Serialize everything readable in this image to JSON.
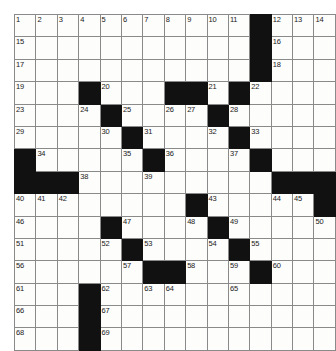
{
  "puzzle": {
    "type": "crossword-grid",
    "title": "",
    "rows": 15,
    "columns": 15,
    "cell_size_px": 20.5,
    "colors": {
      "block": "#111111",
      "cell": "#fdfdfb",
      "grid_line": "#8a8a8a",
      "number": "#1a1a1a",
      "page_background": "#ffffff"
    },
    "highest_clue_number": 69,
    "blocks": [
      [
        1,
        12
      ],
      [
        2,
        12
      ],
      [
        3,
        12
      ],
      [
        4,
        4
      ],
      [
        4,
        8
      ],
      [
        4,
        9
      ],
      [
        4,
        11
      ],
      [
        5,
        5
      ],
      [
        5,
        10
      ],
      [
        6,
        6
      ],
      [
        6,
        11
      ],
      [
        7,
        1
      ],
      [
        7,
        7
      ],
      [
        7,
        12
      ],
      [
        8,
        1
      ],
      [
        8,
        2
      ],
      [
        8,
        3
      ],
      [
        8,
        13
      ],
      [
        8,
        14
      ],
      [
        8,
        15
      ],
      [
        9,
        9
      ],
      [
        9,
        15
      ],
      [
        10,
        5
      ],
      [
        10,
        10
      ],
      [
        11,
        6
      ],
      [
        11,
        11
      ],
      [
        12,
        7
      ],
      [
        12,
        8
      ],
      [
        12,
        12
      ],
      [
        13,
        4
      ],
      [
        14,
        4
      ],
      [
        15,
        4
      ]
    ],
    "numbered_cells": [
      {
        "number": 1,
        "row": 1,
        "col": 1
      },
      {
        "number": 2,
        "row": 1,
        "col": 2
      },
      {
        "number": 3,
        "row": 1,
        "col": 3
      },
      {
        "number": 4,
        "row": 1,
        "col": 4
      },
      {
        "number": 5,
        "row": 1,
        "col": 5
      },
      {
        "number": 6,
        "row": 1,
        "col": 6
      },
      {
        "number": 7,
        "row": 1,
        "col": 7
      },
      {
        "number": 8,
        "row": 1,
        "col": 8
      },
      {
        "number": 9,
        "row": 1,
        "col": 9
      },
      {
        "number": 10,
        "row": 1,
        "col": 10
      },
      {
        "number": 11,
        "row": 1,
        "col": 11
      },
      {
        "number": 12,
        "row": 1,
        "col": 13
      },
      {
        "number": 13,
        "row": 1,
        "col": 14
      },
      {
        "number": 14,
        "row": 1,
        "col": 15
      },
      {
        "number": 15,
        "row": 2,
        "col": 1
      },
      {
        "number": 16,
        "row": 2,
        "col": 13
      },
      {
        "number": 17,
        "row": 3,
        "col": 1
      },
      {
        "number": 18,
        "row": 3,
        "col": 13
      },
      {
        "number": 19,
        "row": 4,
        "col": 1
      },
      {
        "number": 20,
        "row": 4,
        "col": 5
      },
      {
        "number": 21,
        "row": 4,
        "col": 10
      },
      {
        "number": 22,
        "row": 4,
        "col": 12
      },
      {
        "number": 23,
        "row": 5,
        "col": 1
      },
      {
        "number": 24,
        "row": 5,
        "col": 4
      },
      {
        "number": 25,
        "row": 5,
        "col": 6
      },
      {
        "number": 26,
        "row": 5,
        "col": 8
      },
      {
        "number": 27,
        "row": 5,
        "col": 9
      },
      {
        "number": 28,
        "row": 5,
        "col": 11
      },
      {
        "number": 29,
        "row": 6,
        "col": 1
      },
      {
        "number": 30,
        "row": 6,
        "col": 5
      },
      {
        "number": 31,
        "row": 6,
        "col": 7
      },
      {
        "number": 32,
        "row": 6,
        "col": 10
      },
      {
        "number": 33,
        "row": 6,
        "col": 12
      },
      {
        "number": 34,
        "row": 7,
        "col": 2
      },
      {
        "number": 35,
        "row": 7,
        "col": 6
      },
      {
        "number": 36,
        "row": 7,
        "col": 8
      },
      {
        "number": 37,
        "row": 7,
        "col": 11
      },
      {
        "number": 38,
        "row": 8,
        "col": 4
      },
      {
        "number": 39,
        "row": 8,
        "col": 7
      },
      {
        "number": 40,
        "row": 9,
        "col": 1
      },
      {
        "number": 41,
        "row": 9,
        "col": 2
      },
      {
        "number": 42,
        "row": 9,
        "col": 3
      },
      {
        "number": 43,
        "row": 9,
        "col": 10
      },
      {
        "number": 44,
        "row": 9,
        "col": 13
      },
      {
        "number": 45,
        "row": 9,
        "col": 14
      },
      {
        "number": 46,
        "row": 10,
        "col": 1
      },
      {
        "number": 47,
        "row": 10,
        "col": 6
      },
      {
        "number": 48,
        "row": 10,
        "col": 9
      },
      {
        "number": 49,
        "row": 10,
        "col": 11
      },
      {
        "number": 50,
        "row": 10,
        "col": 15
      },
      {
        "number": 51,
        "row": 11,
        "col": 1
      },
      {
        "number": 52,
        "row": 11,
        "col": 5
      },
      {
        "number": 53,
        "row": 11,
        "col": 7
      },
      {
        "number": 54,
        "row": 11,
        "col": 10
      },
      {
        "number": 55,
        "row": 11,
        "col": 12
      },
      {
        "number": 56,
        "row": 12,
        "col": 1
      },
      {
        "number": 57,
        "row": 12,
        "col": 6
      },
      {
        "number": 58,
        "row": 12,
        "col": 9
      },
      {
        "number": 59,
        "row": 12,
        "col": 11
      },
      {
        "number": 60,
        "row": 12,
        "col": 13
      },
      {
        "number": 61,
        "row": 13,
        "col": 1
      },
      {
        "number": 62,
        "row": 13,
        "col": 5
      },
      {
        "number": 63,
        "row": 13,
        "col": 7
      },
      {
        "number": 64,
        "row": 13,
        "col": 8
      },
      {
        "number": 65,
        "row": 13,
        "col": 11
      },
      {
        "number": 66,
        "row": 14,
        "col": 1
      },
      {
        "number": 67,
        "row": 14,
        "col": 5
      },
      {
        "number": 68,
        "row": 15,
        "col": 1
      },
      {
        "number": 69,
        "row": 15,
        "col": 5
      }
    ],
    "filled_letters": []
  }
}
